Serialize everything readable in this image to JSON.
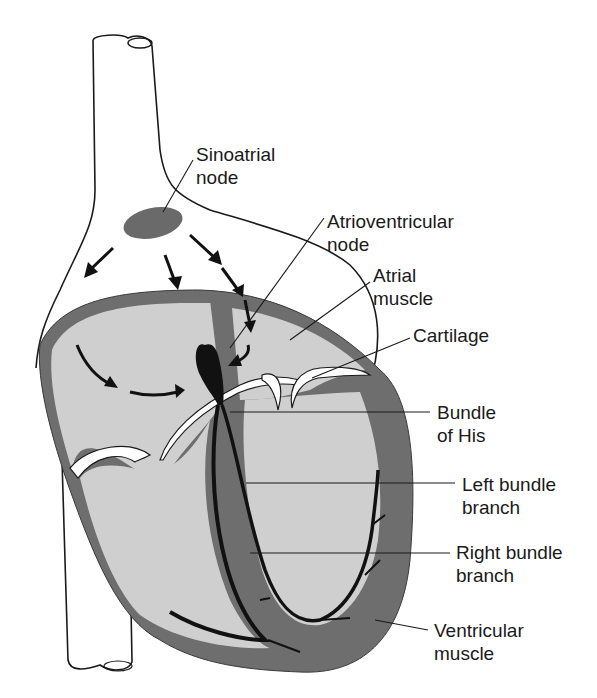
{
  "diagram": {
    "colors": {
      "background": "#ffffff",
      "outline": "#1a1a1a",
      "muscle": "#6e6e6e",
      "chamber": "#cfcfcf",
      "node": "#6a6a6a",
      "conduction": "#111111",
      "cartilage": "#ffffff"
    },
    "labels": [
      {
        "id": "sinoatrial-node",
        "lines": [
          "Sinoatrial",
          "node"
        ]
      },
      {
        "id": "atrioventricular-node",
        "lines": [
          "Atrioventricular",
          "node"
        ]
      },
      {
        "id": "atrial-muscle",
        "lines": [
          "Atrial",
          "muscle"
        ]
      },
      {
        "id": "cartilage",
        "lines": [
          "Cartilage"
        ]
      },
      {
        "id": "bundle-of-his",
        "lines": [
          "Bundle",
          "of His"
        ]
      },
      {
        "id": "left-bundle-branch",
        "lines": [
          "Left bundle",
          "branch"
        ]
      },
      {
        "id": "right-bundle-branch",
        "lines": [
          "Right bundle",
          "branch"
        ]
      },
      {
        "id": "ventricular-muscle",
        "lines": [
          "Ventricular",
          "muscle"
        ]
      }
    ]
  }
}
